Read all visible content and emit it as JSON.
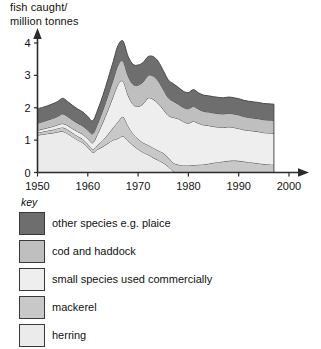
{
  "chart_data": {
    "type": "area",
    "stacked": true,
    "title": "fish caught/\nmillion tonnes",
    "xlabel": "",
    "ylabel": "fish caught/ million tonnes",
    "xlim": [
      1950,
      2000
    ],
    "ylim": [
      0,
      4
    ],
    "xticks": [
      1950,
      1960,
      1970,
      1980,
      1990,
      2000
    ],
    "yticks": [
      0,
      1,
      2,
      3,
      4
    ],
    "grid": false,
    "legend_position": "below",
    "legend_title": "key",
    "data_end_year": 1997,
    "x": [
      1950,
      1951,
      1952,
      1953,
      1954,
      1955,
      1956,
      1957,
      1958,
      1959,
      1960,
      1961,
      1962,
      1963,
      1964,
      1965,
      1966,
      1967,
      1968,
      1969,
      1970,
      1971,
      1972,
      1973,
      1974,
      1975,
      1976,
      1977,
      1978,
      1979,
      1980,
      1981,
      1982,
      1983,
      1984,
      1985,
      1986,
      1987,
      1988,
      1989,
      1990,
      1991,
      1992,
      1993,
      1994,
      1995,
      1996,
      1997
    ],
    "series": [
      {
        "name": "herring",
        "color": "#ebebeb",
        "order": 1,
        "values": [
          1.15,
          1.18,
          1.2,
          1.22,
          1.25,
          1.27,
          1.2,
          1.1,
          1.0,
          0.92,
          0.78,
          0.62,
          0.72,
          0.8,
          0.9,
          1.0,
          1.05,
          1.12,
          0.98,
          0.84,
          0.72,
          0.62,
          0.55,
          0.46,
          0.38,
          0.3,
          0.18,
          0.04,
          0.0,
          0.0,
          0.0,
          0.0,
          0.0,
          0.0,
          0.0,
          0.0,
          0.0,
          0.0,
          0.0,
          0.0,
          0.0,
          0.0,
          0.0,
          0.0,
          0.0,
          0.0,
          0.0,
          0.0
        ]
      },
      {
        "name": "mackerel",
        "color": "#c8c8c8",
        "order": 2,
        "values": [
          0.08,
          0.08,
          0.09,
          0.1,
          0.11,
          0.12,
          0.12,
          0.12,
          0.12,
          0.11,
          0.1,
          0.1,
          0.14,
          0.2,
          0.28,
          0.38,
          0.52,
          0.6,
          0.46,
          0.36,
          0.32,
          0.3,
          0.3,
          0.3,
          0.3,
          0.3,
          0.28,
          0.26,
          0.24,
          0.22,
          0.22,
          0.23,
          0.24,
          0.25,
          0.27,
          0.3,
          0.32,
          0.34,
          0.36,
          0.37,
          0.36,
          0.34,
          0.32,
          0.3,
          0.28,
          0.26,
          0.25,
          0.24
        ]
      },
      {
        "name": "small species used commercially",
        "color": "#eeeeee",
        "order": 3,
        "values": [
          0.07,
          0.08,
          0.09,
          0.1,
          0.11,
          0.12,
          0.13,
          0.13,
          0.14,
          0.15,
          0.16,
          0.2,
          0.35,
          0.55,
          0.75,
          0.95,
          1.15,
          1.1,
          0.95,
          0.9,
          1.0,
          1.2,
          1.45,
          1.5,
          1.45,
          1.35,
          1.3,
          1.4,
          1.42,
          1.35,
          1.3,
          1.35,
          1.28,
          1.22,
          1.18,
          1.12,
          1.08,
          1.05,
          1.05,
          1.02,
          1.0,
          0.98,
          0.98,
          0.98,
          0.98,
          0.97,
          0.97,
          0.97
        ]
      },
      {
        "name": "cod and haddock",
        "color": "#bfbfbf",
        "order": 4,
        "values": [
          0.22,
          0.23,
          0.24,
          0.25,
          0.26,
          0.3,
          0.28,
          0.27,
          0.26,
          0.26,
          0.27,
          0.28,
          0.32,
          0.38,
          0.45,
          0.52,
          0.6,
          0.62,
          0.6,
          0.62,
          0.66,
          0.68,
          0.7,
          0.72,
          0.7,
          0.62,
          0.55,
          0.5,
          0.45,
          0.44,
          0.45,
          0.46,
          0.44,
          0.42,
          0.42,
          0.42,
          0.42,
          0.42,
          0.42,
          0.42,
          0.42,
          0.41,
          0.4,
          0.4,
          0.4,
          0.4,
          0.4,
          0.4
        ]
      },
      {
        "name": "other species e.g. plaice",
        "color": "#6e6e6e",
        "order": 5,
        "values": [
          0.45,
          0.44,
          0.44,
          0.45,
          0.46,
          0.48,
          0.46,
          0.45,
          0.44,
          0.43,
          0.42,
          0.4,
          0.42,
          0.45,
          0.5,
          0.55,
          0.6,
          0.62,
          0.6,
          0.62,
          0.62,
          0.6,
          0.58,
          0.6,
          0.6,
          0.58,
          0.55,
          0.54,
          0.52,
          0.5,
          0.5,
          0.52,
          0.5,
          0.5,
          0.5,
          0.5,
          0.5,
          0.5,
          0.5,
          0.5,
          0.5,
          0.5,
          0.5,
          0.5,
          0.5,
          0.5,
          0.5,
          0.5
        ]
      }
    ]
  },
  "chart": {
    "axis_title": "fish caught/\nmillion tonnes",
    "y_ticks": [
      "0",
      "1",
      "2",
      "3",
      "4"
    ],
    "x_ticks": [
      "1950",
      "1960",
      "1970",
      "1980",
      "1990",
      "2000"
    ]
  },
  "legend": {
    "title": "key",
    "items": [
      {
        "label": "other species e.g. plaice",
        "color": "#6e6e6e"
      },
      {
        "label": "cod and haddock",
        "color": "#bfbfbf"
      },
      {
        "label": "small species used commercially",
        "color": "#eeeeee"
      },
      {
        "label": "mackerel",
        "color": "#c8c8c8"
      },
      {
        "label": "herring",
        "color": "#ebebeb"
      }
    ]
  }
}
